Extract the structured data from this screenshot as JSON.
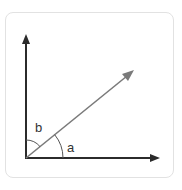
{
  "diagram": {
    "labels": {
      "angle_a": "a",
      "angle_b": "b"
    },
    "colors": {
      "axis": "#2b2b2b",
      "vector": "#7a7a7a",
      "arc": "#555555",
      "border": "#e2e2e2"
    }
  }
}
